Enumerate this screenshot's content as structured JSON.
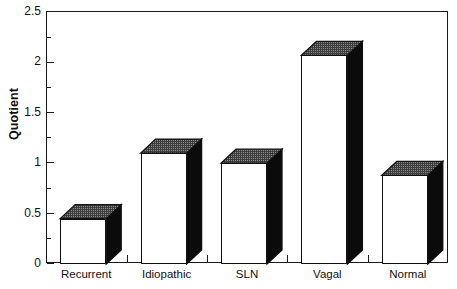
{
  "chart_data": {
    "type": "bar",
    "title": "",
    "subtitle": "",
    "xlabel": "",
    "ylabel": "Quotient",
    "categories": [
      "Recurrent",
      "Idiopathic",
      "SLN",
      "Vagal",
      "Normal"
    ],
    "values": [
      0.45,
      1.1,
      1.0,
      2.07,
      0.88
    ],
    "series": [
      {
        "name": "Quotient",
        "values": [
          0.45,
          1.1,
          1.0,
          2.07,
          0.88
        ]
      }
    ],
    "ylim": [
      0,
      2.5
    ],
    "y_major_ticks": [
      0,
      0.5,
      1,
      1.5,
      2,
      2.5
    ],
    "y_major_tick_labels": [
      "0",
      "0.5",
      "1",
      "1.5",
      "2",
      "2.5"
    ],
    "y_minor_ticks": [
      0.25,
      0.75,
      1.25,
      1.75,
      2.25
    ],
    "grid": "off",
    "legend": "none",
    "style": "3d-bar-black-and-white",
    "bar_style": {
      "front_face_color": "#ffffff",
      "top_face_color": "#4a4a4a",
      "side_face_color": "#0b0b0b",
      "outline_color": "#111111"
    },
    "annotations": []
  },
  "axes": {
    "frame_color": "#1a1a1a"
  }
}
